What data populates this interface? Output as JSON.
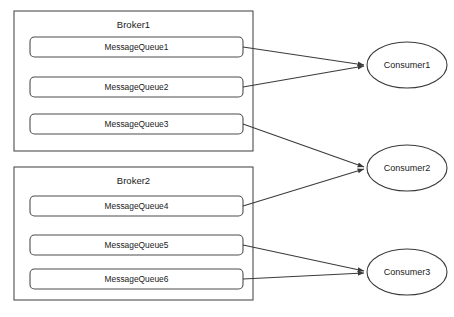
{
  "diagram": {
    "title_artifact": "",
    "brokers": [
      {
        "id": "broker1",
        "label": "Broker1",
        "queues": [
          {
            "id": "mq1",
            "label": "MessageQueue1"
          },
          {
            "id": "mq2",
            "label": "MessageQueue2"
          },
          {
            "id": "mq3",
            "label": "MessageQueue3"
          }
        ]
      },
      {
        "id": "broker2",
        "label": "Broker2",
        "queues": [
          {
            "id": "mq4",
            "label": "MessageQueue4"
          },
          {
            "id": "mq5",
            "label": "MessageQueue5"
          },
          {
            "id": "mq6",
            "label": "MessageQueue6"
          }
        ]
      }
    ],
    "consumers": [
      {
        "id": "consumer1",
        "label": "Consumer1"
      },
      {
        "id": "consumer2",
        "label": "Consumer2"
      },
      {
        "id": "consumer3",
        "label": "Consumer3"
      }
    ],
    "connections": [
      {
        "from": "mq1",
        "to": "consumer1"
      },
      {
        "from": "mq2",
        "to": "consumer1"
      },
      {
        "from": "mq3",
        "to": "consumer2"
      },
      {
        "from": "mq4",
        "to": "consumer2"
      },
      {
        "from": "mq5",
        "to": "consumer3"
      },
      {
        "from": "mq6",
        "to": "consumer3"
      }
    ],
    "colors": {
      "stroke": "#4d4d4d",
      "line": "#3a3a3a",
      "text": "#1a1a1a",
      "background": "#ffffff"
    }
  }
}
